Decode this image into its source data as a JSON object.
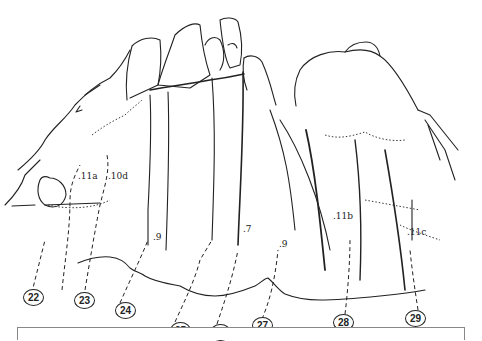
{
  "topo": {
    "routes": [
      {
        "number": "22",
        "x": 33,
        "y": 289
      },
      {
        "number": "23",
        "x": 62,
        "y": 292
      },
      {
        "number": "24",
        "x": 113,
        "y": 303
      },
      {
        "number": "25",
        "x": 167,
        "y": 322
      },
      {
        "number": "26",
        "x": 208,
        "y": 324
      },
      {
        "number": "27",
        "x": 252,
        "y": 319
      },
      {
        "number": "28",
        "x": 335,
        "y": 314
      },
      {
        "number": "29",
        "x": 408,
        "y": 310
      }
    ],
    "grades": [
      {
        "label": ".11a",
        "x": 72,
        "y": 170
      },
      {
        "label": ".10d",
        "x": 107,
        "y": 170
      },
      {
        "label": ".9",
        "x": 154,
        "y": 234
      },
      {
        "label": ".7",
        "x": 242,
        "y": 223
      },
      {
        "label": ".9",
        "x": 278,
        "y": 238
      },
      {
        "label": ".11b",
        "x": 332,
        "y": 210
      },
      {
        "label": ".11c",
        "x": 407,
        "y": 226
      }
    ]
  },
  "colors": {
    "ink": "#222222",
    "paper": "#ffffff",
    "box_border": "#888888"
  }
}
